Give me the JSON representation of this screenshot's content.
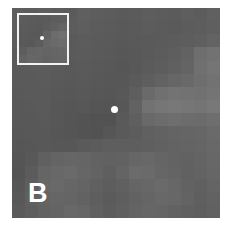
{
  "panel": {
    "label": "B",
    "background": "#5a5a5a",
    "marker_color": "#ffffff",
    "grid_cols": 16,
    "grid_rows": 16,
    "pixels": [
      [
        "#5e5e5e",
        "#5c5c5c",
        "#5e5e5e",
        "#5c5c5c",
        "#5b5b5b",
        "#5f5f5f",
        "#5d5d5d",
        "#5c5c5c",
        "#5a5a5a",
        "#5b5b5b",
        "#5d5d5d",
        "#5c5c5c",
        "#5b5b5b",
        "#5e5e5e",
        "#5c5c5c",
        "#606060"
      ],
      [
        "#5d5d5d",
        "#5e5e5e",
        "#5f5f5f",
        "#5b5b5b",
        "#5c5c5c",
        "#5e5e5e",
        "#5c5c5c",
        "#5b5b5b",
        "#595959",
        "#5a5a5a",
        "#5c5c5c",
        "#5b5b5b",
        "#5a5a5a",
        "#5c5c5c",
        "#5d5d5d",
        "#5f5f5f"
      ],
      [
        "#5c5c5c",
        "#5d5d5d",
        "#5e5e5e",
        "#5c5c5c",
        "#5a5a5a",
        "#5c5c5c",
        "#5b5b5b",
        "#5a5a5a",
        "#585858",
        "#595959",
        "#5a5a5a",
        "#5b5b5b",
        "#5c5c5c",
        "#5d5d5d",
        "#5f5f5f",
        "#636363"
      ],
      [
        "#5b5b5b",
        "#5c5c5c",
        "#5d5d5d",
        "#5b5b5b",
        "#5a5a5a",
        "#5b5b5b",
        "#5a5a5a",
        "#595959",
        "#575757",
        "#585858",
        "#5a5a5a",
        "#5c5c5c",
        "#5e5e5e",
        "#626262",
        "#6e6e6e",
        "#727272"
      ],
      [
        "#5a5a5a",
        "#5b5b5b",
        "#5c5c5c",
        "#5a5a5a",
        "#595959",
        "#5a5a5a",
        "#595959",
        "#585858",
        "#565656",
        "#585858",
        "#5b5b5b",
        "#5d5d5d",
        "#606060",
        "#646464",
        "#707070",
        "#757575"
      ],
      [
        "#5a5a5a",
        "#5a5a5a",
        "#5b5b5b",
        "#595959",
        "#585858",
        "#595959",
        "#585858",
        "#575757",
        "#575757",
        "#5a5a5a",
        "#5e5e5e",
        "#626262",
        "#666666",
        "#696969",
        "#6e6e6e",
        "#727272"
      ],
      [
        "#595959",
        "#5a5a5a",
        "#5a5a5a",
        "#585858",
        "#575757",
        "#585858",
        "#575757",
        "#565656",
        "#585858",
        "#5e5e5e",
        "#6a6a6a",
        "#707070",
        "#737373",
        "#727272",
        "#717171",
        "#747474"
      ],
      [
        "#585858",
        "#595959",
        "#5a5a5a",
        "#575757",
        "#565656",
        "#575757",
        "#555555",
        "#545454",
        "#575757",
        "#626262",
        "#727272",
        "#767676",
        "#787878",
        "#767676",
        "#747474",
        "#787878"
      ],
      [
        "#585858",
        "#585858",
        "#595959",
        "#575757",
        "#555555",
        "#545454",
        "#525252",
        "#525252",
        "#595959",
        "#5f5f5f",
        "#696969",
        "#6c6c6c",
        "#6e6e6e",
        "#6c6c6c",
        "#6b6b6b",
        "#6e6e6e"
      ],
      [
        "#575757",
        "#585858",
        "#585858",
        "#565656",
        "#555555",
        "#535353",
        "#525252",
        "#565656",
        "#5a5a5a",
        "#5c5c5c",
        "#606060",
        "#626262",
        "#646464",
        "#656565",
        "#666666",
        "#6a6a6a"
      ],
      [
        "#565656",
        "#575757",
        "#585858",
        "#575757",
        "#575757",
        "#5a5a5a",
        "#5c5c5c",
        "#5e5e5e",
        "#5e5e5e",
        "#5e5e5e",
        "#5f5f5f",
        "#616161",
        "#636363",
        "#646464",
        "#656565",
        "#686868"
      ],
      [
        "#555555",
        "#585858",
        "#606060",
        "#646464",
        "#666666",
        "#656565",
        "#626262",
        "#616161",
        "#626262",
        "#666666",
        "#686868",
        "#656565",
        "#636363",
        "#626262",
        "#646464",
        "#676767"
      ],
      [
        "#545454",
        "#5b5b5b",
        "#656565",
        "#686868",
        "#6a6a6a",
        "#666666",
        "#636363",
        "#5f5f5f",
        "#646464",
        "#6b6b6b",
        "#6a6a6a",
        "#666666",
        "#646464",
        "#616161",
        "#636363",
        "#666666"
      ],
      [
        "#565656",
        "#5e5e5e",
        "#676767",
        "#696969",
        "#666666",
        "#646464",
        "#606060",
        "#5d5d5d",
        "#606060",
        "#656565",
        "#676767",
        "#6a6a6a",
        "#676767",
        "#626262",
        "#606060",
        "#646464"
      ],
      [
        "#585858",
        "#606060",
        "#646464",
        "#666666",
        "#656565",
        "#626262",
        "#5e5e5e",
        "#5b5b5b",
        "#5e5e5e",
        "#626262",
        "#656565",
        "#686868",
        "#676767",
        "#636363",
        "#5f5f5f",
        "#626262"
      ],
      [
        "#5a5a5a",
        "#5e5e5e",
        "#626262",
        "#646464",
        "#686868",
        "#666666",
        "#606060",
        "#5c5c5c",
        "#5f5f5f",
        "#646464",
        "#666666",
        "#656565",
        "#626262",
        "#606060",
        "#5e5e5e",
        "#616161"
      ]
    ],
    "marker": {
      "x": 102,
      "y": 101
    }
  },
  "inset": {
    "border_color": "#f2f2f2",
    "pixels": [
      [
        "#5c5c5c",
        "#5b5b5b",
        "#5a5a5a",
        "#5b5b5b",
        "#5d5d5d",
        "#5e5e5e"
      ],
      [
        "#5b5b5b",
        "#5a5a5a",
        "#595959",
        "#5c5c5c",
        "#606060",
        "#656565"
      ],
      [
        "#5a5a5a",
        "#595959",
        "#585858",
        "#626262",
        "#6c6c6c",
        "#707070"
      ],
      [
        "#595959",
        "#585858",
        "#5c5c5c",
        "#666666",
        "#6a6a6a",
        "#6c6c6c"
      ],
      [
        "#5d5d5d",
        "#646464",
        "#666666",
        "#646464",
        "#656565",
        "#676767"
      ],
      [
        "#626262",
        "#676767",
        "#656565",
        "#626262",
        "#646464",
        "#666666"
      ]
    ]
  }
}
